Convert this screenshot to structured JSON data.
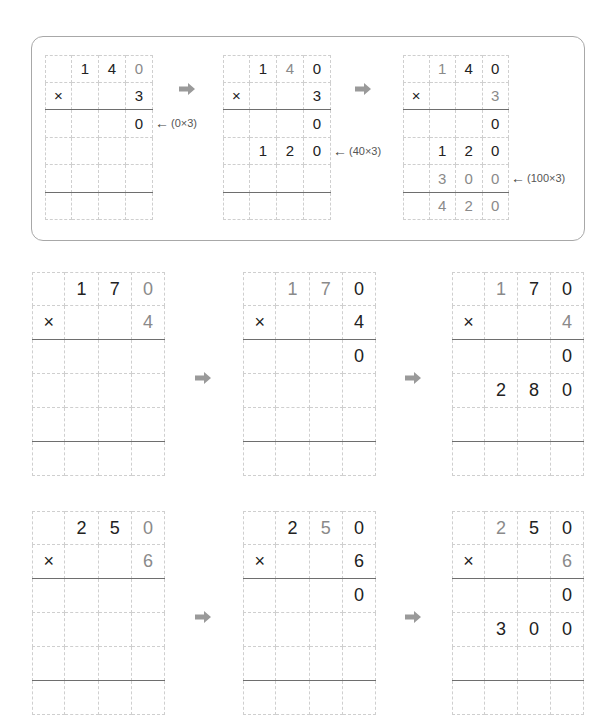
{
  "colors": {
    "dark": "#222222",
    "gray": "#8a8a8a",
    "arrow": "#9a9a9a",
    "border": "#a8a8a8"
  },
  "example_box": {
    "grids": [
      {
        "rows": [
          [
            "",
            "1",
            "4",
            "0"
          ],
          [
            "×",
            "",
            "",
            "3"
          ],
          [
            "",
            "",
            "",
            "0"
          ],
          [
            "",
            "",
            "",
            ""
          ],
          [
            "",
            "",
            "",
            ""
          ],
          [
            "",
            "",
            "",
            ""
          ]
        ],
        "gray": [
          [
            0,
            3
          ]
        ]
      },
      {
        "rows": [
          [
            "",
            "1",
            "4",
            "0"
          ],
          [
            "×",
            "",
            "",
            "3"
          ],
          [
            "",
            "",
            "",
            "0"
          ],
          [
            "",
            "1",
            "2",
            "0"
          ],
          [
            "",
            "",
            "",
            ""
          ],
          [
            "",
            "",
            "",
            ""
          ]
        ],
        "gray": [
          [
            0,
            2
          ]
        ]
      },
      {
        "rows": [
          [
            "",
            "1",
            "4",
            "0"
          ],
          [
            "×",
            "",
            "",
            "3"
          ],
          [
            "",
            "",
            "",
            "0"
          ],
          [
            "",
            "1",
            "2",
            "0"
          ],
          [
            "",
            "3",
            "0",
            "0"
          ],
          [
            "",
            "4",
            "2",
            "0"
          ]
        ],
        "gray": [
          [
            0,
            1
          ],
          [
            1,
            3
          ],
          [
            4,
            1
          ],
          [
            4,
            2
          ],
          [
            4,
            3
          ],
          [
            5,
            1
          ],
          [
            5,
            2
          ],
          [
            5,
            3
          ]
        ]
      }
    ],
    "notes": [
      "(0×3)",
      "(40×3)",
      "(100×3)"
    ],
    "arrow_glyph": "←"
  },
  "problem_1": {
    "grids": [
      {
        "rows": [
          [
            "",
            "1",
            "7",
            "0"
          ],
          [
            "×",
            "",
            "",
            "4"
          ],
          [
            "",
            "",
            "",
            ""
          ],
          [
            "",
            "",
            "",
            ""
          ],
          [
            "",
            "",
            "",
            ""
          ],
          [
            "",
            "",
            "",
            ""
          ]
        ],
        "gray": [
          [
            0,
            3
          ],
          [
            1,
            3
          ]
        ]
      },
      {
        "rows": [
          [
            "",
            "1",
            "7",
            "0"
          ],
          [
            "×",
            "",
            "",
            "4"
          ],
          [
            "",
            "",
            "",
            "0"
          ],
          [
            "",
            "",
            "",
            ""
          ],
          [
            "",
            "",
            "",
            ""
          ],
          [
            "",
            "",
            "",
            ""
          ]
        ],
        "gray": [
          [
            0,
            1
          ],
          [
            0,
            2
          ]
        ]
      },
      {
        "rows": [
          [
            "",
            "1",
            "7",
            "0"
          ],
          [
            "×",
            "",
            "",
            "4"
          ],
          [
            "",
            "",
            "",
            "0"
          ],
          [
            "",
            "2",
            "8",
            "0"
          ],
          [
            "",
            "",
            "",
            ""
          ],
          [
            "",
            "",
            "",
            ""
          ]
        ],
        "gray": [
          [
            0,
            1
          ],
          [
            1,
            3
          ]
        ]
      }
    ]
  },
  "problem_2": {
    "grids": [
      {
        "rows": [
          [
            "",
            "2",
            "5",
            "0"
          ],
          [
            "×",
            "",
            "",
            "6"
          ],
          [
            "",
            "",
            "",
            ""
          ],
          [
            "",
            "",
            "",
            ""
          ],
          [
            "",
            "",
            "",
            ""
          ],
          [
            "",
            "",
            "",
            ""
          ]
        ],
        "gray": [
          [
            0,
            3
          ],
          [
            1,
            3
          ]
        ]
      },
      {
        "rows": [
          [
            "",
            "2",
            "5",
            "0"
          ],
          [
            "×",
            "",
            "",
            "6"
          ],
          [
            "",
            "",
            "",
            "0"
          ],
          [
            "",
            "",
            "",
            ""
          ],
          [
            "",
            "",
            "",
            ""
          ],
          [
            "",
            "",
            "",
            ""
          ]
        ],
        "gray": [
          [
            0,
            2
          ]
        ]
      },
      {
        "rows": [
          [
            "",
            "2",
            "5",
            "0"
          ],
          [
            "×",
            "",
            "",
            "6"
          ],
          [
            "",
            "",
            "",
            "0"
          ],
          [
            "",
            "3",
            "0",
            "0"
          ],
          [
            "",
            "",
            "",
            ""
          ],
          [
            "",
            "",
            "",
            ""
          ]
        ],
        "gray": [
          [
            0,
            1
          ],
          [
            1,
            3
          ]
        ]
      }
    ]
  }
}
